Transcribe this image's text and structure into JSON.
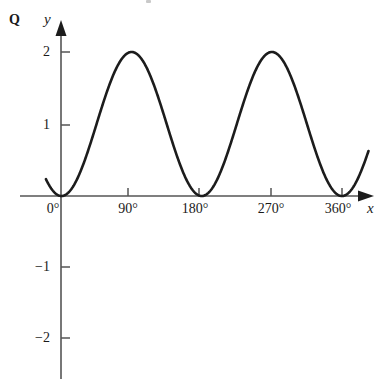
{
  "figure": {
    "question_label": "Q",
    "x_axis_label": "x",
    "y_axis_label": "y"
  },
  "colors": {
    "curve": "#1c1c1c",
    "axis": "#555555",
    "text": "#1a1a1a",
    "background": "#ffffff"
  },
  "chart_data": {
    "type": "line",
    "title": "",
    "subtitle": "",
    "xlabel": "x",
    "ylabel": "y",
    "function": "y = 1 - cos(2x)",
    "grid": false,
    "legend": null,
    "xlim": [
      -20,
      405
    ],
    "ylim": [
      -2.6,
      2.4
    ],
    "xunit": "degrees",
    "x_tick_labels": [
      "0°",
      "90°",
      "180°",
      "270°",
      "360°"
    ],
    "x_tick_values": [
      0,
      90,
      180,
      270,
      360
    ],
    "y_tick_labels": [
      "2",
      "1",
      "−1",
      "−2"
    ],
    "y_tick_values": [
      2,
      1,
      -1,
      -2
    ],
    "series": [
      {
        "name": "y",
        "x": [
          -20,
          -10,
          0,
          10,
          20,
          30,
          40,
          50,
          60,
          70,
          80,
          90,
          100,
          110,
          120,
          130,
          140,
          150,
          160,
          170,
          180,
          190,
          200,
          210,
          220,
          230,
          240,
          250,
          260,
          270,
          280,
          290,
          300,
          310,
          320,
          330,
          340,
          350,
          360,
          370,
          380,
          390,
          400
        ],
        "values": [
          0.234,
          0.06,
          0.0,
          0.06,
          0.234,
          0.5,
          0.826,
          1.174,
          1.5,
          1.766,
          1.94,
          2.0,
          1.94,
          1.766,
          1.5,
          1.174,
          0.826,
          0.5,
          0.234,
          0.06,
          0.0,
          0.06,
          0.234,
          0.5,
          0.826,
          1.174,
          1.5,
          1.766,
          1.94,
          2.0,
          1.94,
          1.766,
          1.5,
          1.174,
          0.826,
          0.5,
          0.234,
          0.06,
          0.0,
          0.06,
          0.234,
          0.5,
          0.826
        ]
      }
    ],
    "maxima": [
      {
        "x": 90,
        "y": 2
      },
      {
        "x": 270,
        "y": 2
      }
    ],
    "minima": [
      {
        "x": 0,
        "y": 0
      },
      {
        "x": 180,
        "y": 0
      },
      {
        "x": 360,
        "y": 0
      }
    ],
    "amplitude": 1,
    "period": 180,
    "midline": 1
  }
}
